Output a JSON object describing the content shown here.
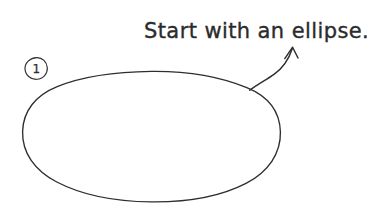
{
  "canvas": {
    "width": 370,
    "height": 214,
    "background_color": "#ffffff",
    "ink_color": "#2e2e30",
    "style": "hand-drawn pen sketch"
  },
  "annotation": {
    "caption": "Start with an ellipse.",
    "caption_x": 144,
    "caption_baseline_y": 38
  },
  "step_marker": {
    "number": "1",
    "shape": "circle",
    "center_x": 36,
    "center_y": 68,
    "radius": 11
  },
  "shapes": [
    {
      "name": "ellipse",
      "type": "ellipse",
      "center_x": 151,
      "center_y": 136,
      "radius_x": 129,
      "radius_y": 65,
      "stroke_width": 1.3,
      "filled": false
    }
  ],
  "arrow": {
    "name": "pointer-arrow",
    "description": "curved arrow from ellipse edge up to the caption",
    "tail_x": 250,
    "tail_y": 90,
    "tip_x": 293,
    "tip_y": 47,
    "stroke_width": 1.4
  }
}
